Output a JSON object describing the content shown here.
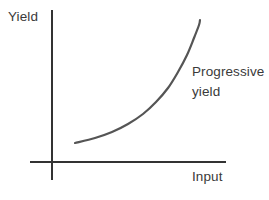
{
  "figure": {
    "name": "progressive-yield-graph",
    "background_color": "#ffffff"
  },
  "axes": {
    "y_label": "Yield",
    "x_label": "Input",
    "axis_color": "#333333",
    "y_axis": {
      "x": 52,
      "y_top": 10,
      "y_bottom": 180
    },
    "x_axis": {
      "y": 162,
      "x_left": 30,
      "x_right": 226
    }
  },
  "annotation": {
    "line1": "Progressive",
    "line2": "yield",
    "color": "#3a3a3a"
  },
  "chart_data": {
    "type": "line",
    "title": "",
    "xlabel": "Input",
    "ylabel": "Yield",
    "grid": false,
    "legend": false,
    "series": [
      {
        "name": "Progressive yield",
        "color": "#555555",
        "line_width": 2.2,
        "points_px": [
          [
            75,
            143
          ],
          [
            95,
            138
          ],
          [
            112,
            132
          ],
          [
            128,
            124
          ],
          [
            143,
            114
          ],
          [
            156,
            102
          ],
          [
            168,
            88
          ],
          [
            178,
            72
          ],
          [
            187,
            55
          ],
          [
            194,
            38
          ],
          [
            199,
            25
          ],
          [
            200,
            20
          ]
        ]
      }
    ],
    "axis_ranges": {
      "x": [
        0,
        1
      ],
      "y": [
        0,
        1
      ]
    }
  }
}
